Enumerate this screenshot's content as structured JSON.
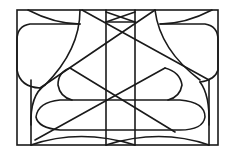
{
  "diagram": {
    "stroke_color": "#1a1a1a",
    "background": "#ffffff"
  }
}
